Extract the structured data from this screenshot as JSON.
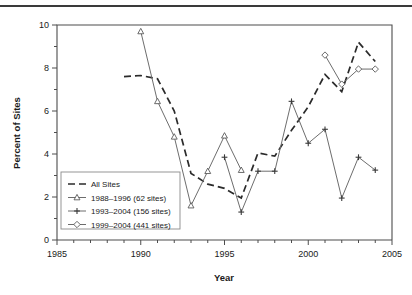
{
  "figure": {
    "name": "percent-of-sites-by-year-line-chart",
    "has_top_rule": true
  },
  "chart_data": {
    "type": "line",
    "title": "",
    "xlabel": "Year",
    "ylabel": "Percent of Sites",
    "xlim": [
      1985,
      2005
    ],
    "ylim": [
      0,
      10
    ],
    "xticks": [
      1985,
      1990,
      1995,
      2000,
      2005
    ],
    "xtick_labels": [
      "1985",
      "1990",
      "1995",
      "2000",
      "2005"
    ],
    "xminor_step": 1,
    "yticks": [
      0,
      2,
      4,
      6,
      8,
      10
    ],
    "ytick_labels": [
      "0",
      "2",
      "4",
      "6",
      "8",
      "10"
    ],
    "yminor_step": 1,
    "grid": false,
    "legend_position": "lower-left-inside",
    "series": [
      {
        "name": "All Sites",
        "style": "dashed",
        "marker": "none",
        "color": "#2b2b2b",
        "x": [
          1989,
          1990,
          1991,
          1992,
          1993,
          1994,
          1995,
          1996,
          1997,
          1998,
          1999,
          2000,
          2001,
          2002,
          2003,
          2004
        ],
        "values": [
          7.6,
          7.65,
          7.5,
          6.0,
          3.1,
          2.6,
          2.4,
          1.95,
          4.05,
          3.9,
          5.1,
          6.2,
          7.7,
          6.9,
          9.2,
          8.3
        ]
      },
      {
        "name": "1988–1996 (62 sites)",
        "style": "solid",
        "marker": "triangle",
        "color": "#6d6d6d",
        "x": [
          1990,
          1991,
          1992,
          1993,
          1994,
          1995,
          1996
        ],
        "values": [
          9.7,
          6.45,
          4.8,
          1.6,
          3.2,
          4.85,
          3.25
        ]
      },
      {
        "name": "1993–2004 (156 sites)",
        "style": "solid",
        "marker": "plus",
        "color": "#6d6d6d",
        "x": [
          1995,
          1996,
          1997,
          1998,
          1999,
          2000,
          2001,
          2002,
          2003,
          2004
        ],
        "values": [
          3.85,
          1.3,
          3.2,
          3.2,
          6.45,
          4.5,
          5.15,
          1.95,
          3.85,
          3.25
        ]
      },
      {
        "name": "1999–2004 (441 sites)",
        "style": "solid",
        "marker": "diamond",
        "color": "#6d6d6d",
        "x": [
          2001,
          2002,
          2003,
          2004
        ],
        "values": [
          8.6,
          7.25,
          7.95,
          7.95
        ]
      }
    ],
    "legend_entries": [
      {
        "label": "All Sites",
        "marker": "none",
        "style": "dashed"
      },
      {
        "label": "1988–1996 (62 sites)",
        "marker": "triangle",
        "style": "solid"
      },
      {
        "label": "1993–2004 (156 sites)",
        "marker": "plus",
        "style": "solid"
      },
      {
        "label": "1999–2004 (441 sites)",
        "marker": "diamond",
        "style": "solid"
      }
    ]
  },
  "colors": {
    "axis": "#4d4d4d",
    "dashed_series": "#2b2b2b",
    "solid_series": "#6d6d6d",
    "text": "#1a1a1a",
    "background": "#ffffff",
    "top_rule": "#3a3a3a"
  }
}
